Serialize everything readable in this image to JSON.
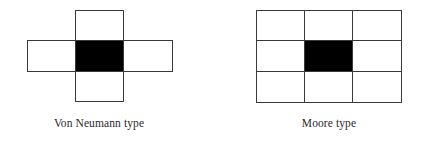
{
  "diagrams": [
    {
      "id": "von-neumann",
      "label": "Von Neumann type",
      "label_center_x": 99,
      "cols": [
        27,
        75,
        123,
        172
      ],
      "rows": [
        10,
        40,
        71,
        101
      ],
      "cells": [
        {
          "r": 0,
          "c": 1,
          "filled": false
        },
        {
          "r": 1,
          "c": 0,
          "filled": false
        },
        {
          "r": 1,
          "c": 1,
          "filled": true
        },
        {
          "r": 1,
          "c": 2,
          "filled": false
        },
        {
          "r": 2,
          "c": 1,
          "filled": false
        }
      ]
    },
    {
      "id": "moore",
      "label": "Moore type",
      "label_center_x": 329,
      "cols": [
        256,
        304,
        352,
        401
      ],
      "rows": [
        10,
        40,
        71,
        102
      ],
      "cells": [
        {
          "r": 0,
          "c": 0,
          "filled": false
        },
        {
          "r": 0,
          "c": 1,
          "filled": false
        },
        {
          "r": 0,
          "c": 2,
          "filled": false
        },
        {
          "r": 1,
          "c": 0,
          "filled": false
        },
        {
          "r": 1,
          "c": 1,
          "filled": true
        },
        {
          "r": 1,
          "c": 2,
          "filled": false
        },
        {
          "r": 2,
          "c": 0,
          "filled": false
        },
        {
          "r": 2,
          "c": 1,
          "filled": false
        },
        {
          "r": 2,
          "c": 2,
          "filled": false
        }
      ]
    }
  ],
  "colors": {
    "cell_border": "#3a3a3a",
    "cell_fill": "#ffffff",
    "center_fill": "#000000",
    "label_text": "#2a2a2a"
  }
}
